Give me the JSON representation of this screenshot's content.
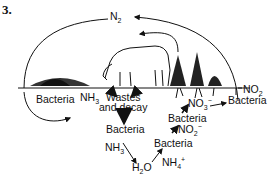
{
  "figure_number": "3.",
  "labels": {
    "n2": "N",
    "n2_sub": "2",
    "no2_right": "NO",
    "no2_right_sub": "2",
    "bacteria_left": "Bacteria",
    "nh3_top": "NH",
    "nh3_top_sub": "3",
    "wastes": "Wastes",
    "decay": "and decay",
    "bacteria_center": "Bacteria",
    "nh3_mid": "NH",
    "nh3_mid_sub": "3",
    "h2o_h": "H",
    "h2o_sub": "2",
    "h2o_o": "O",
    "nh4": "NH",
    "nh4_sub": "4",
    "nh4_sup": "+",
    "bacteria_lower": "Bacteria",
    "no2_mid": "NO",
    "no2_mid_sub": "2",
    "no2_mid_sup": "−",
    "bacteria_upper": "Bacteria",
    "no3": "NO",
    "no3_sub": "3",
    "no3_sup": "−",
    "bacteria_right": "Bacteria"
  },
  "colors": {
    "ink": "#111111",
    "background": "#ffffff"
  }
}
